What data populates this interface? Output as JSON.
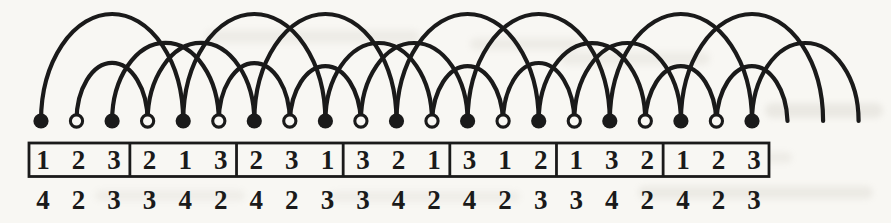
{
  "figure": {
    "type": "arc-diagram",
    "ink_color": "#1a1a1a",
    "paper_color": "#f8f7f3",
    "vertices": [
      "filled",
      "open",
      "filled",
      "open",
      "filled",
      "open",
      "filled",
      "open",
      "filled",
      "open",
      "filled",
      "open",
      "filled",
      "open",
      "filled",
      "open",
      "filled",
      "open",
      "filled",
      "open",
      "filled"
    ],
    "table_groups": [
      [
        "1",
        "2",
        "3"
      ],
      [
        "2",
        "1",
        "3"
      ],
      [
        "2",
        "3",
        "1"
      ],
      [
        "3",
        "2",
        "1"
      ],
      [
        "3",
        "1",
        "2"
      ],
      [
        "1",
        "3",
        "2"
      ],
      [
        "1",
        "2",
        "3"
      ]
    ],
    "below_numbers": [
      "4",
      "2",
      "3",
      "3",
      "4",
      "2",
      "4",
      "2",
      "3",
      "3",
      "4",
      "2",
      "4",
      "2",
      "3",
      "3",
      "4",
      "2",
      "4",
      "2",
      "3"
    ]
  }
}
